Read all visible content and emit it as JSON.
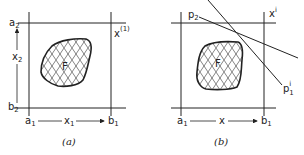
{
  "panel_a": {
    "caption": "(a)",
    "region_label": "F",
    "a2": {
      "base": "a",
      "sub": "2"
    },
    "b2": {
      "base": "b",
      "sub": "2"
    },
    "x2": {
      "base": "x",
      "sub": "2"
    },
    "a1": {
      "base": "a",
      "sub": "1"
    },
    "b1": {
      "base": "b",
      "sub": "1"
    },
    "x1": {
      "base": "x",
      "sub": "1"
    },
    "point": {
      "base": "x",
      "sup": "(1)"
    }
  },
  "panel_b": {
    "caption": "(b)",
    "region_label": "F",
    "a1": {
      "base": "a",
      "sub": "1"
    },
    "b1": {
      "base": "b",
      "sub": "1"
    },
    "x": "x",
    "point": {
      "base": "x",
      "sup": "i"
    },
    "p2": {
      "base": "p",
      "sub": "2"
    },
    "p1": {
      "base": "p",
      "sub": "1",
      "sup": "i"
    }
  },
  "colors": {
    "ink": "#222222",
    "background": "#ffffff"
  }
}
